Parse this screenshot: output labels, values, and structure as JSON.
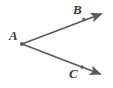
{
  "figure": {
    "kind": "geometry-diagram",
    "background_color": "#ffffff",
    "stroke_color": "#5a5a60",
    "label_color": "#3b3b3b",
    "width": 113,
    "height": 88,
    "labels": {
      "vertex": "A",
      "upper_point": "B",
      "lower_point": "C"
    },
    "points": {
      "A": {
        "x": 22,
        "y": 44
      },
      "B": {
        "x": 84,
        "y": 19
      },
      "C": {
        "x": 82,
        "y": 67
      }
    },
    "rays": [
      {
        "name": "ray-AB",
        "from": "A",
        "through": "B",
        "x1": 22,
        "y1": 44,
        "x2": 104,
        "y2": 13,
        "arrow": "end"
      },
      {
        "name": "ray-AC",
        "from": "A",
        "through": "C",
        "x1": 22,
        "y1": 44,
        "x2": 103,
        "y2": 75,
        "arrow": "end"
      }
    ]
  }
}
